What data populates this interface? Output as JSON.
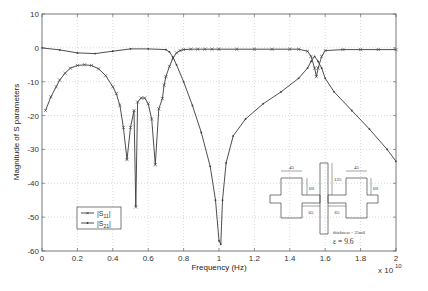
{
  "chart_data": {
    "type": "line",
    "title": "",
    "xlabel": "Frequency (Hz)",
    "ylabel": "Magnitude of S parameters",
    "x_multiplier_label": "x 10",
    "x_multiplier_exp": "10",
    "xlim": [
      0,
      2
    ],
    "ylim": [
      -60,
      10
    ],
    "xticks": [
      0,
      0.2,
      0.4,
      0.6,
      0.8,
      1,
      1.2,
      1.4,
      1.6,
      1.8,
      2
    ],
    "xtick_labels": [
      "0",
      "0.2",
      "0.4",
      "0.6",
      "0.8",
      "1",
      "1.2",
      "1.4",
      "1.6",
      "1.8",
      "2"
    ],
    "yticks": [
      10,
      0,
      -10,
      -20,
      -30,
      -40,
      -50,
      -60
    ],
    "ytick_labels": [
      "10",
      "0",
      "-10",
      "-20",
      "-30",
      "-40",
      "-50",
      "-60"
    ],
    "grid": true,
    "legend_position": "lower-left inside",
    "series": [
      {
        "name": "|S11|",
        "marker": "x",
        "x": [
          0.02,
          0.05,
          0.08,
          0.1,
          0.13,
          0.16,
          0.2,
          0.24,
          0.28,
          0.32,
          0.36,
          0.4,
          0.42,
          0.44,
          0.46,
          0.48,
          0.5,
          0.52,
          0.53,
          0.54,
          0.56,
          0.58,
          0.6,
          0.62,
          0.64,
          0.66,
          0.68,
          0.69,
          0.7,
          0.72,
          0.74,
          0.76,
          0.78,
          0.8,
          0.84,
          0.88,
          0.92,
          0.96,
          1.0,
          1.1,
          1.2,
          1.3,
          1.4,
          1.45,
          1.5,
          1.52,
          1.54,
          1.55,
          1.56,
          1.58,
          1.6,
          1.7,
          1.8,
          1.9,
          2.0
        ],
        "y": [
          -18.5,
          -14.5,
          -11.5,
          -9.5,
          -7.5,
          -6.0,
          -5.2,
          -5.0,
          -5.2,
          -6.2,
          -8.2,
          -11.5,
          -13.5,
          -17.0,
          -23.5,
          -33.0,
          -23.5,
          -18.5,
          -47.0,
          -16.0,
          -14.8,
          -14.8,
          -16.5,
          -21.0,
          -34.5,
          -18.0,
          -15.0,
          -11.0,
          -8.5,
          -5.5,
          -3.0,
          -1.5,
          -0.8,
          -0.5,
          -0.4,
          -0.4,
          -0.4,
          -0.4,
          -0.4,
          -0.4,
          -0.4,
          -0.4,
          -0.4,
          -0.4,
          -1.0,
          -2.5,
          -6.0,
          -8.5,
          -6.0,
          -2.5,
          -0.8,
          -0.5,
          -0.5,
          -0.5,
          -0.5
        ]
      },
      {
        "name": "|S21|",
        "marker": ".",
        "x": [
          0.0,
          0.1,
          0.2,
          0.3,
          0.4,
          0.5,
          0.6,
          0.7,
          0.72,
          0.74,
          0.76,
          0.8,
          0.85,
          0.9,
          0.95,
          0.98,
          1.0,
          1.01,
          1.02,
          1.04,
          1.08,
          1.15,
          1.25,
          1.35,
          1.45,
          1.5,
          1.52,
          1.54,
          1.56,
          1.58,
          1.6,
          1.65,
          1.75,
          1.85,
          1.95,
          2.0
        ],
        "y": [
          0.0,
          -0.6,
          -1.5,
          -1.7,
          -1.0,
          -0.3,
          -0.3,
          -0.5,
          -1.2,
          -2.8,
          -5.0,
          -10.0,
          -17.0,
          -25.0,
          -35.0,
          -45.0,
          -57.0,
          -58.0,
          -45.0,
          -34.0,
          -26.0,
          -21.0,
          -16.5,
          -13.0,
          -9.0,
          -6.0,
          -4.0,
          -2.5,
          -4.0,
          -6.0,
          -9.0,
          -13.0,
          -18.5,
          -24.0,
          -30.0,
          -33.5
        ]
      }
    ],
    "inset": {
      "dims": [
        "45",
        "60",
        "125",
        "45",
        "60",
        "65",
        "65"
      ],
      "thickness_label": "thickness = 25mil",
      "epsilon_label": "ε = 9.6"
    }
  },
  "colors": {
    "line": "#3a3a3a",
    "grid": "#bdbdbd",
    "axis": "#555555"
  }
}
